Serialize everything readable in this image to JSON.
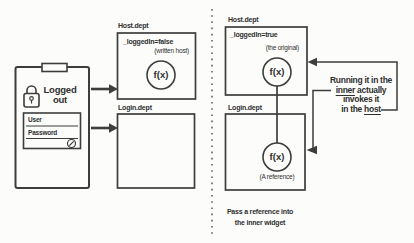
{
  "colors": {
    "ink": "#3d3d3d",
    "bg": "#fcfcfb",
    "text": "#2f2f2f"
  },
  "divider": {
    "style": "dashed-vertical"
  },
  "left": {
    "device": {
      "lock_icon": "padlock-icon",
      "status_line1": "Logged",
      "status_line2": "out",
      "form": {
        "user_label": "User",
        "password_label": "Password",
        "submit_icon": "submit-circle-icon"
      }
    },
    "host_panel": {
      "title": "Host.dept",
      "state": "_loggedIn=false",
      "note": "(written host)",
      "fn": "f(x)"
    },
    "login_panel": {
      "title": "Login.dept"
    }
  },
  "right": {
    "host_panel": {
      "title": "Host.dept",
      "state": "_loggedIn=true",
      "note": "(the original)",
      "fn": "f(x)"
    },
    "login_panel": {
      "title": "Login.dept",
      "fn": "f(x)",
      "note": "(A reference)"
    },
    "callout": {
      "line1": "Running it in the",
      "line2_u": "inner",
      "line2_rest": " actually",
      "line3": "invokes it",
      "line4_pre": "in the ",
      "line4_u": "host"
    },
    "caption_line1": "Pass a reference into",
    "caption_line2": "the inner widget"
  }
}
